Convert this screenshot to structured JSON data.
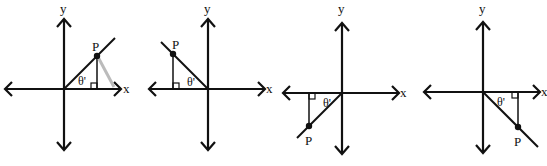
{
  "figure": {
    "panels": [
      {
        "quadrant": "I",
        "axis_x": "x",
        "axis_y": "y",
        "point": "P",
        "angle": "θ'"
      },
      {
        "quadrant": "II",
        "axis_x": "x",
        "axis_y": "y",
        "point": "P",
        "angle": "θ'"
      },
      {
        "quadrant": "III",
        "axis_x": "x",
        "axis_y": "y",
        "point": "P",
        "angle": "θ'"
      },
      {
        "quadrant": "IV",
        "axis_x": "x",
        "axis_y": "y",
        "point": "P",
        "angle": "θ'"
      }
    ]
  },
  "colors": {
    "ink": "#111111",
    "shadow": "#b8b8b8",
    "background": "#ffffff"
  }
}
